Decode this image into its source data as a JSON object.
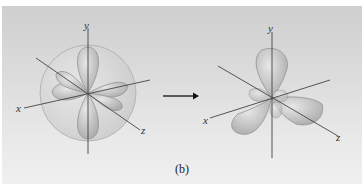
{
  "figure": {
    "caption": "(b)",
    "left_diagram": {
      "description": "s + three p orbitals combined inside a sphere",
      "axis_labels": {
        "x": "x",
        "y": "y",
        "z": "z"
      }
    },
    "right_diagram": {
      "description": "resulting sp3-like hybrid orbitals",
      "axis_labels": {
        "x": "x",
        "y": "y",
        "z": "z"
      }
    },
    "arrow": "right-arrow",
    "colors": {
      "background_top": "#cfcfcf",
      "background_bottom": "#f0f0f0",
      "lobe_fill": "#bdbdbd",
      "lobe_stroke": "#8a8a8a",
      "axis": "#444444"
    }
  }
}
